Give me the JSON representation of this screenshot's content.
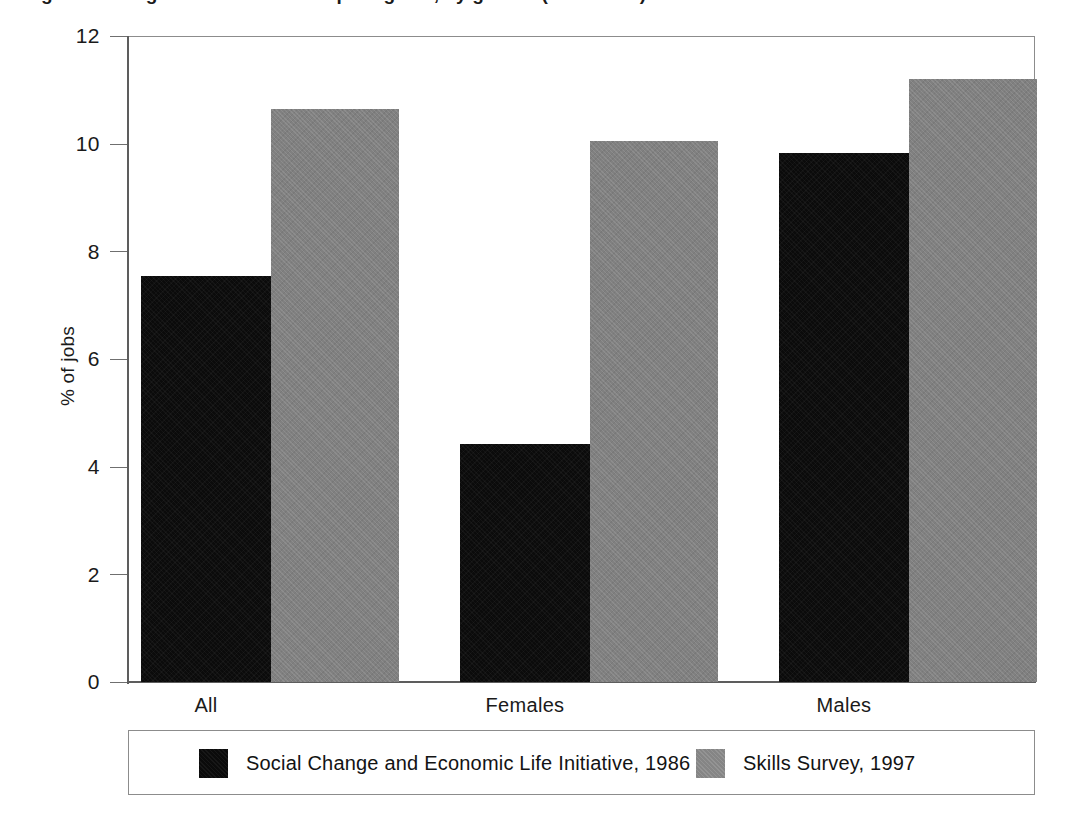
{
  "figure": {
    "title_cropped": "Figure 4: Long-term trends in computing use, by gender (1986-1997)",
    "title_visible": false
  },
  "chart_data": {
    "type": "bar",
    "title": "",
    "xlabel": "",
    "ylabel": "% of jobs",
    "categories": [
      "All",
      "Females",
      "Males"
    ],
    "ylim": [
      0,
      12
    ],
    "yticks": [
      0,
      2,
      4,
      6,
      8,
      10,
      12
    ],
    "ytick_labels": [
      "0",
      "2",
      "4",
      "6",
      "8",
      "10",
      "12"
    ],
    "grid": false,
    "legend_position": "bottom",
    "series": [
      {
        "name": "Social Change and Economic Life Initiative, 1986",
        "color": "#0b0b0b",
        "values": [
          7.55,
          4.42,
          9.83
        ]
      },
      {
        "name": "Skills Survey, 1997",
        "color": "#808080",
        "values": [
          10.65,
          10.05,
          11.2
        ]
      }
    ]
  },
  "legend": {
    "entries": [
      {
        "label": "Social Change and Economic Life Initiative, 1986",
        "swatch": "black-swatch"
      },
      {
        "label": "Skills Survey, 1997",
        "swatch": "gray-swatch"
      }
    ]
  },
  "axes": {
    "y_title": "% of jobs",
    "y_tick_labels": [
      "12",
      "10",
      "8",
      "6",
      "4",
      "2",
      "0"
    ],
    "x_tick_labels": [
      "All",
      "Females",
      "Males"
    ]
  }
}
